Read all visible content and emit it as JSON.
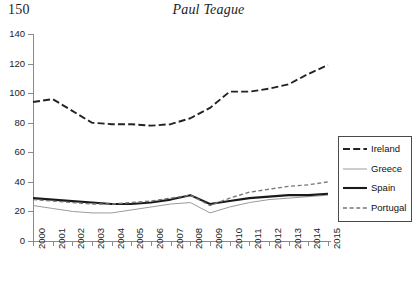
{
  "page": {
    "folio": "150",
    "running_title": "Paul Teague"
  },
  "legend": {
    "position": "right-middle",
    "items": [
      {
        "label": "Ireland",
        "style": "long-dash",
        "color": "#222222",
        "width": 1.9
      },
      {
        "label": "Greece",
        "style": "solid",
        "color": "#9b9b9b",
        "width": 1.0
      },
      {
        "label": "Spain",
        "style": "solid",
        "color": "#1a1a1a",
        "width": 2.1
      },
      {
        "label": "Portugal",
        "style": "short-dash",
        "color": "#777777",
        "width": 1.3
      }
    ]
  },
  "chart_data": {
    "type": "line",
    "title": "",
    "xlabel": "",
    "ylabel": "",
    "ylim": [
      0,
      140
    ],
    "yticks": [
      0,
      20,
      40,
      60,
      80,
      100,
      120,
      140
    ],
    "grid": false,
    "legend_position": "right",
    "categories": [
      "2000",
      "2001",
      "2002",
      "2003",
      "2004",
      "2005",
      "2006",
      "2007",
      "2008",
      "2009",
      "2010",
      "2011",
      "2012",
      "2013",
      "2014",
      "2015"
    ],
    "series": [
      {
        "name": "Ireland",
        "style": "long-dash",
        "color": "#222222",
        "values": [
          94,
          96,
          88,
          80,
          79,
          79,
          78,
          79,
          83,
          90,
          101,
          101,
          103,
          106,
          113,
          119
        ]
      },
      {
        "name": "Greece",
        "style": "solid",
        "color": "#9b9b9b",
        "values": [
          24,
          22,
          20,
          19,
          19,
          21,
          23,
          25,
          26,
          19,
          23,
          26,
          28,
          29,
          30,
          31
        ]
      },
      {
        "name": "Spain",
        "style": "solid",
        "color": "#1a1a1a",
        "values": [
          29,
          28,
          27,
          26,
          25,
          25,
          26,
          28,
          31,
          25,
          27,
          29,
          30,
          31,
          31,
          32
        ]
      },
      {
        "name": "Portugal",
        "style": "short-dash",
        "color": "#777777",
        "values": [
          28,
          27,
          26,
          25,
          25,
          26,
          27,
          29,
          31,
          24,
          29,
          33,
          35,
          37,
          38,
          40
        ]
      }
    ]
  }
}
